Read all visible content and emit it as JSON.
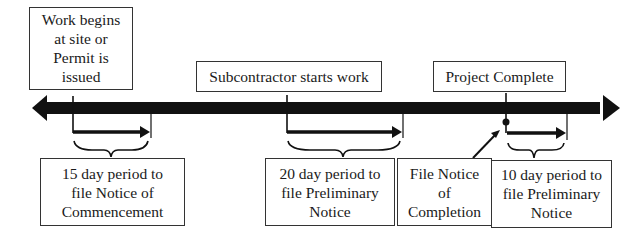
{
  "diagram": {
    "type": "timeline",
    "colors": {
      "line": "#111111",
      "box_border": "#333333",
      "background": "#ffffff"
    },
    "events": [
      {
        "id": "work-begins",
        "lines": [
          "Work begins",
          "at site or",
          "Permit is",
          "issued"
        ]
      },
      {
        "id": "subcontractor-starts",
        "lines": [
          "Subcontractor starts work"
        ]
      },
      {
        "id": "project-complete",
        "lines": [
          "Project Complete"
        ]
      }
    ],
    "periods": [
      {
        "id": "notice-of-commencement",
        "lines": [
          "15 day period to",
          "file Notice of",
          "Commencement"
        ]
      },
      {
        "id": "preliminary-notice-20",
        "lines": [
          "20 day period to",
          "file Preliminary",
          "Notice"
        ]
      },
      {
        "id": "notice-of-completion",
        "lines": [
          "File Notice",
          "of",
          "Completion"
        ]
      },
      {
        "id": "preliminary-notice-10",
        "lines": [
          "10 day period to",
          "file Preliminary",
          "Notice"
        ]
      }
    ]
  }
}
